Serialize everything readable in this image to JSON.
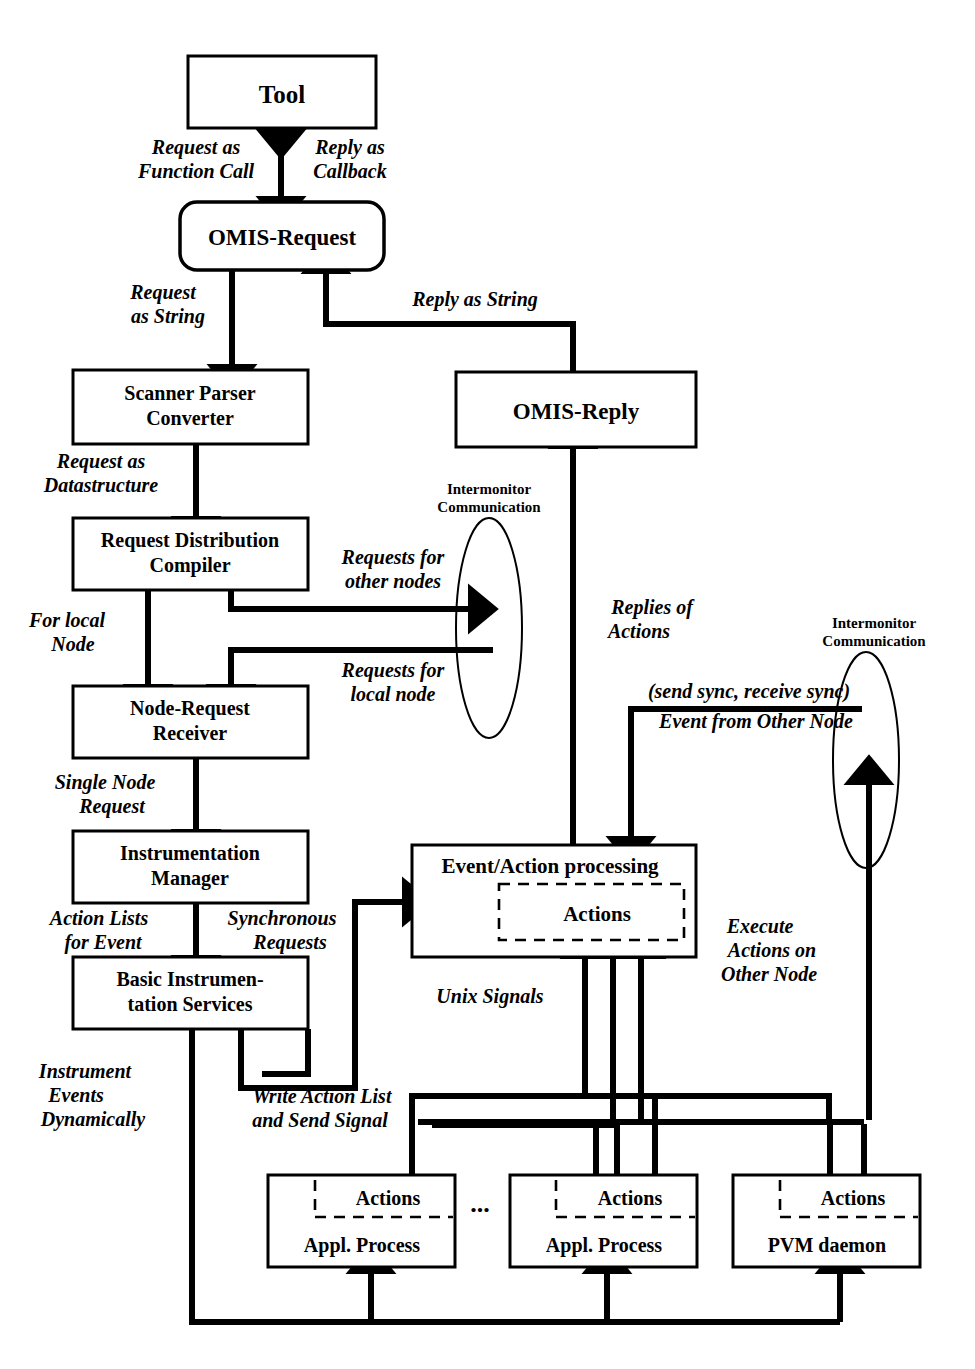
{
  "diagram": {
    "nodes": {
      "tool": "Tool",
      "omis_request": "OMIS-Request",
      "scanner": {
        "line1": "Scanner Parser",
        "line2": "Converter"
      },
      "rdc": {
        "line1": "Request Distribution",
        "line2": "Compiler"
      },
      "nrr": {
        "line1": "Node-Request",
        "line2": "Receiver"
      },
      "im": {
        "line1": "Instrumentation",
        "line2": "Manager"
      },
      "bis": {
        "line1": "Basic Instrumen-",
        "line2": "tation Services"
      },
      "omis_reply": "OMIS-Reply",
      "eap": {
        "title": "Event/Action processing",
        "inner": "Actions"
      },
      "proc1": {
        "inner": "Actions",
        "label": "Appl. Process"
      },
      "proc2": {
        "inner": "Actions",
        "label": "Appl. Process"
      },
      "pvm": {
        "inner": "Actions",
        "label": "PVM daemon"
      },
      "ellipsis": "..."
    },
    "ovals": {
      "intermonitor_left": {
        "line1": "Intermonitor",
        "line2": "Communication"
      },
      "intermonitor_right": {
        "line1": "Intermonitor",
        "line2": "Communication"
      }
    },
    "edges": {
      "request_as_function_call": {
        "line1": "Request as",
        "line2": "Function Call"
      },
      "reply_as_callback": {
        "line1": "Reply as",
        "line2": "Callback"
      },
      "request_as_string": {
        "line1": "Request",
        "line2": "as String"
      },
      "reply_as_string": {
        "line1": "Reply as String"
      },
      "request_as_datastructure": {
        "line1": "Request as",
        "line2": "Datastructure"
      },
      "requests_for_other_nodes": {
        "line1": "Requests for",
        "line2": "other nodes"
      },
      "for_local_node": {
        "line1": "For local",
        "line2": "Node"
      },
      "requests_for_local_node": {
        "line1": "Requests for",
        "line2": "local node"
      },
      "single_node_request": {
        "line1": "Single Node",
        "line2": "Request"
      },
      "action_lists_for_event": {
        "line1": "Action Lists",
        "line2": "for Event"
      },
      "synchronous_requests": {
        "line1": "Synchronous",
        "line2": "Requests"
      },
      "instrument_events_dynamically": {
        "line1": "Instrument",
        "line2": "Events",
        "line3": "Dynamically"
      },
      "write_action_list_and_send_signal": {
        "line1": "Write Action List",
        "line2": "and Send Signal"
      },
      "replies_of_actions": {
        "line1": "Replies of",
        "line2": "Actions"
      },
      "send_sync_receive_sync": {
        "line1": "(send sync, receive sync)"
      },
      "event_from_other_node": {
        "line1": "Event from Other Node"
      },
      "unix_signals": {
        "line1": "Unix Signals"
      },
      "execute_actions_on_other_node": {
        "line1": "Execute",
        "line2": "Actions on",
        "line3": "Other Node"
      }
    },
    "colors": {
      "ink": "#000000",
      "paper": "#ffffff"
    }
  }
}
